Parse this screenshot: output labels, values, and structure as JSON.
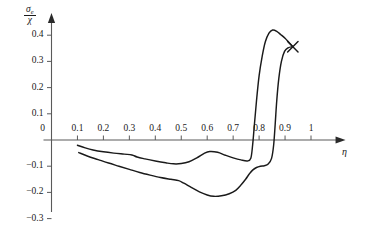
{
  "chart_data": {
    "type": "line",
    "title": "",
    "subtitle": "",
    "xlabel": "η",
    "ylabel_numerator": "σ",
    "ylabel_numerator_sub": "e",
    "ylabel_denominator": "χ",
    "xlim": [
      0,
      1.06
    ],
    "ylim": [
      -0.33,
      0.47
    ],
    "xticks": [
      0,
      0.1,
      0.2,
      0.3,
      0.4,
      0.5,
      0.6,
      0.7,
      0.8,
      0.9,
      1
    ],
    "xtick_labels": [
      "0",
      "0.1",
      "0.2",
      "0.3",
      "0.4",
      "0.5",
      "0.6",
      "0.7",
      "0.8",
      "0.9",
      "1"
    ],
    "yticks": [
      0.4,
      0.3,
      0.2,
      0.1,
      0,
      -0.1,
      -0.2,
      -0.3
    ],
    "ytick_labels": [
      "0.4",
      "0.3",
      "0.2",
      "0.1",
      "0",
      "−0.1",
      "−0.2",
      "−0.3"
    ],
    "grid": false,
    "legend": null,
    "axis_color": "#5a5a5a",
    "curve_color": "#1a1a1a",
    "series": [
      {
        "name": "upper-branch",
        "points": [
          [
            0.1,
            -0.02
          ],
          [
            0.13,
            -0.03
          ],
          [
            0.16,
            -0.038
          ],
          [
            0.2,
            -0.045
          ],
          [
            0.24,
            -0.05
          ],
          [
            0.28,
            -0.054
          ],
          [
            0.31,
            -0.057
          ],
          [
            0.33,
            -0.065
          ],
          [
            0.36,
            -0.072
          ],
          [
            0.4,
            -0.08
          ],
          [
            0.44,
            -0.087
          ],
          [
            0.47,
            -0.091
          ],
          [
            0.5,
            -0.09
          ],
          [
            0.53,
            -0.083
          ],
          [
            0.56,
            -0.068
          ],
          [
            0.59,
            -0.05
          ],
          [
            0.61,
            -0.044
          ],
          [
            0.64,
            -0.047
          ],
          [
            0.67,
            -0.058
          ],
          [
            0.7,
            -0.068
          ],
          [
            0.73,
            -0.076
          ],
          [
            0.755,
            -0.08
          ],
          [
            0.768,
            -0.07
          ],
          [
            0.775,
            -0.02
          ],
          [
            0.782,
            0.06
          ],
          [
            0.79,
            0.15
          ],
          [
            0.8,
            0.245
          ],
          [
            0.812,
            0.32
          ],
          [
            0.824,
            0.375
          ],
          [
            0.838,
            0.408
          ],
          [
            0.852,
            0.42
          ],
          [
            0.868,
            0.415
          ],
          [
            0.884,
            0.402
          ],
          [
            0.9,
            0.388
          ],
          [
            0.915,
            0.372
          ],
          [
            0.93,
            0.356
          ]
        ]
      },
      {
        "name": "lower-branch",
        "points": [
          [
            0.105,
            -0.048
          ],
          [
            0.14,
            -0.062
          ],
          [
            0.18,
            -0.075
          ],
          [
            0.22,
            -0.088
          ],
          [
            0.26,
            -0.1
          ],
          [
            0.3,
            -0.112
          ],
          [
            0.34,
            -0.124
          ],
          [
            0.38,
            -0.134
          ],
          [
            0.42,
            -0.143
          ],
          [
            0.46,
            -0.15
          ],
          [
            0.49,
            -0.155
          ],
          [
            0.51,
            -0.165
          ],
          [
            0.54,
            -0.182
          ],
          [
            0.57,
            -0.198
          ],
          [
            0.6,
            -0.21
          ],
          [
            0.625,
            -0.215
          ],
          [
            0.655,
            -0.213
          ],
          [
            0.685,
            -0.205
          ],
          [
            0.71,
            -0.192
          ],
          [
            0.73,
            -0.172
          ],
          [
            0.748,
            -0.15
          ],
          [
            0.762,
            -0.13
          ],
          [
            0.775,
            -0.115
          ],
          [
            0.79,
            -0.105
          ],
          [
            0.805,
            -0.1
          ],
          [
            0.82,
            -0.098
          ],
          [
            0.835,
            -0.092
          ],
          [
            0.848,
            -0.07
          ],
          [
            0.856,
            -0.02
          ],
          [
            0.862,
            0.06
          ],
          [
            0.868,
            0.15
          ],
          [
            0.876,
            0.235
          ],
          [
            0.886,
            0.3
          ],
          [
            0.898,
            0.338
          ],
          [
            0.912,
            0.352
          ],
          [
            0.928,
            0.356
          ]
        ]
      }
    ],
    "markers": [
      {
        "name": "endpoint-cross",
        "symbol": "x",
        "x": 0.93,
        "y": 0.356
      }
    ]
  }
}
